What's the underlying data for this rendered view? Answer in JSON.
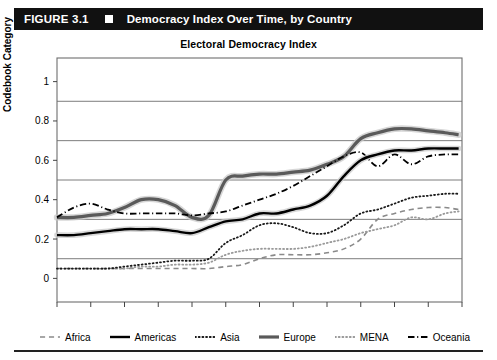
{
  "header": {
    "figure_number": "FIGURE 3.1",
    "marker_icon": "square-bullet-icon",
    "title": "Democracy Index Over Time, by Country",
    "background_color": "#111111",
    "text_color": "#ffffff"
  },
  "chart_data": {
    "type": "line",
    "title": "Electoral Democracy Index",
    "xlabel": "",
    "ylabel": "Codebook Category",
    "xlim": [
      1900,
      2020
    ],
    "ylim": [
      -0.12,
      1.12
    ],
    "grid": true,
    "gridlines_y": [
      0.1,
      0.3,
      0.5,
      0.7,
      0.9
    ],
    "legend_position": "bottom",
    "xticks": [
      1900,
      1910,
      1920,
      1930,
      1940,
      1950,
      1960,
      1970,
      1980,
      1990,
      2000,
      2010,
      2020
    ],
    "xtick_labels": [
      "1900",
      "1910",
      "1920",
      "1930",
      "1940",
      "1950",
      "1960",
      "1970",
      "1980",
      "1990",
      "2000",
      "2010",
      "2..."
    ],
    "yticks": [
      0,
      0.2,
      0.4,
      0.6,
      0.8,
      1
    ],
    "ytick_labels": [
      "0",
      "0.2",
      "0.4",
      "0.6",
      "0.8",
      "1"
    ],
    "x": [
      1900,
      1905,
      1910,
      1915,
      1920,
      1925,
      1930,
      1935,
      1940,
      1945,
      1950,
      1955,
      1960,
      1965,
      1970,
      1975,
      1980,
      1985,
      1990,
      1995,
      2000,
      2005,
      2010,
      2015,
      2019
    ],
    "series": [
      {
        "name": "Africa",
        "style": "dashed",
        "color": "#8a8a8a",
        "width": 1.6,
        "values": [
          0.05,
          0.05,
          0.05,
          0.05,
          0.05,
          0.05,
          0.05,
          0.05,
          0.05,
          0.05,
          0.06,
          0.07,
          0.1,
          0.12,
          0.12,
          0.12,
          0.13,
          0.15,
          0.2,
          0.3,
          0.33,
          0.35,
          0.36,
          0.36,
          0.35
        ]
      },
      {
        "name": "Americas",
        "style": "solid",
        "color": "#000000",
        "width": 2.4,
        "values": [
          0.22,
          0.22,
          0.23,
          0.24,
          0.25,
          0.25,
          0.25,
          0.24,
          0.23,
          0.26,
          0.29,
          0.3,
          0.33,
          0.33,
          0.35,
          0.37,
          0.42,
          0.52,
          0.6,
          0.63,
          0.65,
          0.65,
          0.66,
          0.66,
          0.66
        ]
      },
      {
        "name": "Asia",
        "style": "dotted",
        "color": "#1a1a1a",
        "width": 1.8,
        "values": [
          0.05,
          0.05,
          0.05,
          0.05,
          0.06,
          0.07,
          0.08,
          0.09,
          0.09,
          0.1,
          0.18,
          0.22,
          0.27,
          0.28,
          0.26,
          0.23,
          0.23,
          0.27,
          0.33,
          0.35,
          0.38,
          0.41,
          0.42,
          0.43,
          0.43
        ]
      },
      {
        "name": "Europe",
        "style": "solid",
        "color": "#5a5a5a",
        "width": 3.2,
        "values": [
          0.31,
          0.31,
          0.32,
          0.33,
          0.36,
          0.4,
          0.4,
          0.37,
          0.31,
          0.32,
          0.5,
          0.52,
          0.53,
          0.53,
          0.54,
          0.55,
          0.58,
          0.62,
          0.71,
          0.74,
          0.76,
          0.76,
          0.75,
          0.74,
          0.73
        ]
      },
      {
        "name": "MENA",
        "style": "dotted",
        "color": "#9a9a9a",
        "width": 1.8,
        "values": [
          0.05,
          0.05,
          0.05,
          0.05,
          0.05,
          0.06,
          0.06,
          0.07,
          0.07,
          0.08,
          0.12,
          0.14,
          0.15,
          0.15,
          0.15,
          0.16,
          0.18,
          0.2,
          0.23,
          0.25,
          0.27,
          0.31,
          0.3,
          0.33,
          0.34
        ]
      },
      {
        "name": "Oceania",
        "style": "dashdot",
        "color": "#000000",
        "width": 1.8,
        "values": [
          0.31,
          0.36,
          0.38,
          0.35,
          0.33,
          0.33,
          0.33,
          0.33,
          0.32,
          0.33,
          0.34,
          0.37,
          0.4,
          0.43,
          0.47,
          0.52,
          0.57,
          0.62,
          0.64,
          0.57,
          0.63,
          0.58,
          0.62,
          0.63,
          0.63
        ]
      }
    ]
  }
}
